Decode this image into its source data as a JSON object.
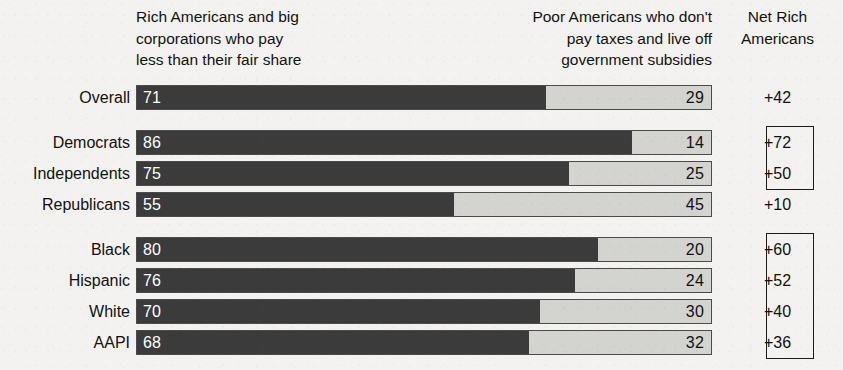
{
  "headers": {
    "left": "Rich Americans and big\ncorporations who pay\nless than their fair share",
    "right": "Poor Americans who don't\npay taxes and live off\ngovernment subsidies",
    "net": "Net Rich\nAmericans"
  },
  "colors": {
    "bar_dark": "#3b3b3b",
    "bar_light": "#d3d3d0",
    "bar_border": "#4b4b4b",
    "text": "#111111",
    "background": "#f3f2f0",
    "box_border": "#1b1b1b"
  },
  "chart_data": {
    "type": "bar",
    "orientation": "horizontal",
    "stacked": true,
    "title": "",
    "xlabel": "",
    "ylabel": "",
    "xlim": [
      0,
      100
    ],
    "grid": false,
    "legend_position": "top",
    "categories": [
      "Overall",
      "Democrats",
      "Independents",
      "Republicans",
      "Black",
      "Hispanic",
      "White",
      "AAPI"
    ],
    "series": [
      {
        "name": "Rich Americans and big corporations who pay less than their fair share",
        "color": "#3b3b3b",
        "values": [
          71,
          86,
          75,
          55,
          80,
          76,
          70,
          68
        ]
      },
      {
        "name": "Poor Americans who don't pay taxes and live off government subsidies",
        "color": "#d3d3d0",
        "values": [
          29,
          14,
          25,
          45,
          20,
          24,
          30,
          32
        ]
      }
    ],
    "net_label": "Net Rich Americans",
    "net_values": [
      "+42",
      "+72",
      "+50",
      "+10",
      "+60",
      "+52",
      "+40",
      "+36"
    ]
  },
  "rows": [
    {
      "label": "Overall",
      "left": 71,
      "right": 29,
      "left_text": "71",
      "right_text": "29",
      "net": "+42",
      "group": 0,
      "boxed": false
    },
    {
      "label": "Democrats",
      "left": 86,
      "right": 14,
      "left_text": "86",
      "right_text": "14",
      "net": "+72",
      "group": 1,
      "boxed": true
    },
    {
      "label": "Independents",
      "left": 75,
      "right": 25,
      "left_text": "75",
      "right_text": "25",
      "net": "+50",
      "group": 1,
      "boxed": true
    },
    {
      "label": "Republicans",
      "left": 55,
      "right": 45,
      "left_text": "55",
      "right_text": "45",
      "net": "+10",
      "group": 1,
      "boxed": false
    },
    {
      "label": "Black",
      "left": 80,
      "right": 20,
      "left_text": "80",
      "right_text": "20",
      "net": "+60",
      "group": 2,
      "boxed": true
    },
    {
      "label": "Hispanic",
      "left": 76,
      "right": 24,
      "left_text": "76",
      "right_text": "24",
      "net": "+52",
      "group": 2,
      "boxed": true
    },
    {
      "label": "White",
      "left": 70,
      "right": 30,
      "left_text": "70",
      "right_text": "30",
      "net": "+40",
      "group": 2,
      "boxed": true
    },
    {
      "label": "AAPI",
      "left": 68,
      "right": 32,
      "left_text": "68",
      "right_text": "32",
      "net": "+36",
      "group": 2,
      "boxed": true
    }
  ],
  "net_boxes": [
    {
      "from_row": 1,
      "to_row": 2
    },
    {
      "from_row": 4,
      "to_row": 7
    }
  ]
}
